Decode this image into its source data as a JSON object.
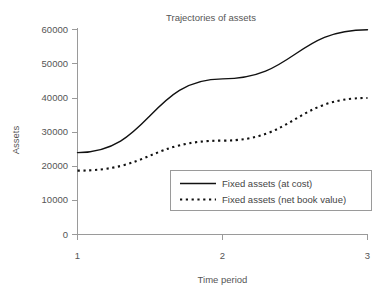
{
  "chart_data": {
    "type": "line",
    "title": "Trajectories of assets",
    "xlabel": "Time period",
    "ylabel": "Assets",
    "x": [
      1,
      2,
      3
    ],
    "xticklabels": [
      "1",
      "2",
      "3"
    ],
    "yticklabels": [
      "0",
      "10000",
      "20000",
      "30000",
      "40000",
      "50000",
      "60000"
    ],
    "yticks": [
      0,
      10000,
      20000,
      30000,
      40000,
      50000,
      60000
    ],
    "ylim": [
      0,
      60000
    ],
    "xlim": [
      1,
      3
    ],
    "grid": false,
    "legend_position": "lower-right",
    "series": [
      {
        "name": "Fixed assets (at cost)",
        "style": "solid",
        "color": "#111111",
        "values": [
          24000,
          45600,
          60000
        ]
      },
      {
        "name": "Fixed assets (net book value)",
        "style": "dotted",
        "color": "#111111",
        "values": [
          18700,
          27500,
          40000
        ]
      }
    ]
  },
  "legend": {
    "entries": [
      {
        "label": "Fixed assets (at cost)"
      },
      {
        "label": "Fixed assets (net book value)"
      }
    ]
  },
  "axis": {
    "y_tick_0": "0",
    "y_tick_1": "10000",
    "y_tick_2": "20000",
    "y_tick_3": "30000",
    "y_tick_4": "40000",
    "y_tick_5": "50000",
    "y_tick_6": "60000",
    "x_tick_0": "1",
    "x_tick_1": "2",
    "x_tick_2": "3"
  }
}
